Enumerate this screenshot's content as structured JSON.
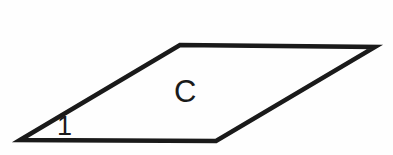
{
  "figure": {
    "kind": "geometry-diagram",
    "background_color": "#fefefe",
    "stroke_color": "#1a1a1a",
    "label_color": "#1a1a1a",
    "width": 393,
    "height": 155
  },
  "shape": {
    "name": "parallelogram",
    "stroke_width": 4.5,
    "vertices": [
      {
        "name": "left-vertex",
        "x": 20,
        "y": 140
      },
      {
        "name": "top-left-vertex",
        "x": 180,
        "y": 45
      },
      {
        "name": "right-vertex",
        "x": 375,
        "y": 47
      },
      {
        "name": "bottom-right-vertex",
        "x": 216,
        "y": 141
      }
    ],
    "polygon_points": "20,140 180,45 375,47 216,141",
    "edges": [
      {
        "name": "left-slant-edge",
        "from": "left-vertex",
        "to": "top-left-vertex"
      },
      {
        "name": "top-edge",
        "from": "top-left-vertex",
        "to": "right-vertex"
      },
      {
        "name": "right-slant-edge",
        "from": "right-vertex",
        "to": "bottom-right-vertex"
      },
      {
        "name": "bottom-edge",
        "from": "bottom-right-vertex",
        "to": "left-vertex"
      }
    ]
  },
  "labels": {
    "interior": "C",
    "angle": "1"
  }
}
